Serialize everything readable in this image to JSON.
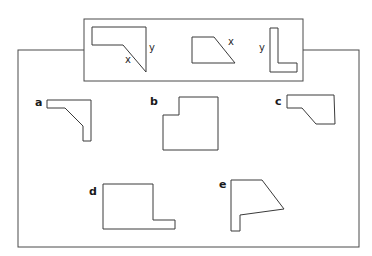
{
  "diagram": {
    "components": [
      {
        "id": "piece-1",
        "points": "92,27 146,27 146,72 123,45 92,45",
        "labels": [
          {
            "text": "x",
            "x": 125,
            "y": 63
          },
          {
            "text": "y",
            "x": 149,
            "y": 51
          }
        ]
      },
      {
        "id": "piece-2",
        "points": "192,37 214,37 235,63 192,63",
        "labels": [
          {
            "text": "x",
            "x": 228,
            "y": 45
          }
        ]
      },
      {
        "id": "piece-3",
        "points": "270,28 278,28 278,63 297,63 297,72 270,72",
        "labels": [
          {
            "text": "y",
            "x": 259,
            "y": 51
          }
        ]
      }
    ],
    "options": [
      {
        "label": "a",
        "label_x": 35,
        "label_y": 106,
        "points": "47,100 91,100 91,141 83,141 83,126 65,108 47,108"
      },
      {
        "label": "b",
        "label_x": 150,
        "label_y": 105,
        "points": "179,97 218,97 218,150 163,150 163,115 179,115"
      },
      {
        "label": "c",
        "label_x": 275,
        "label_y": 105,
        "points": "287,95 334,95 335,124 316,124 302,108 287,108"
      },
      {
        "label": "d",
        "label_x": 89,
        "label_y": 195,
        "points": "103,184 153,184 153,220 175,220 175,229 103,229"
      },
      {
        "label": "e",
        "label_x": 219,
        "label_y": 188,
        "points": "231,180 262,180 284,209 240,215 240,231 231,231"
      }
    ],
    "colors": {
      "stroke": "#3a3a3a",
      "background": "#ffffff",
      "text": "#1a1a1a"
    }
  }
}
